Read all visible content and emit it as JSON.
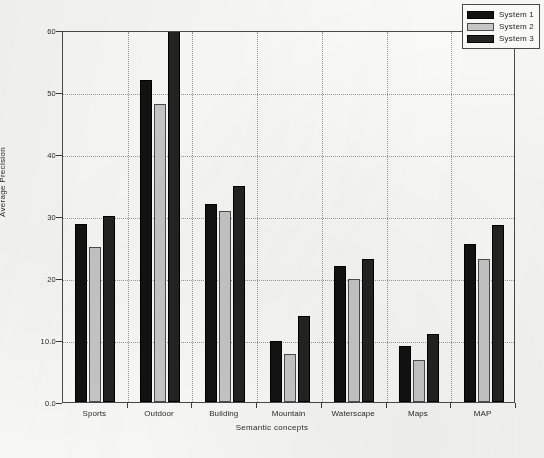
{
  "chart_data": {
    "type": "bar",
    "title": "",
    "xlabel": "Semantic concepts",
    "ylabel": "Average Precision",
    "categories": [
      "Sports",
      "Outdoor",
      "Building",
      "Mountain",
      "Waterscape",
      "Maps",
      "MAP"
    ],
    "series": [
      {
        "name": "System 1",
        "color": "#121212",
        "values": [
          28.7,
          52.0,
          32.0,
          9.8,
          22.0,
          9.0,
          25.5
        ]
      },
      {
        "name": "System 2",
        "color": "#c9c9c9",
        "values": [
          25.0,
          48.0,
          30.8,
          7.8,
          19.8,
          6.8,
          23.0
        ]
      },
      {
        "name": "System 3",
        "color": "#232323",
        "values": [
          30.0,
          60.0,
          34.8,
          13.9,
          23.0,
          10.9,
          28.5
        ]
      }
    ],
    "ylim": [
      0,
      60
    ],
    "ytick_values": [
      0,
      10,
      20,
      30,
      40,
      50,
      60
    ],
    "ytick_labels": [
      "0.0",
      "10.0",
      "20",
      "30",
      "40",
      "50",
      "60"
    ],
    "grid": "dotted",
    "legend_position": "top-right"
  }
}
